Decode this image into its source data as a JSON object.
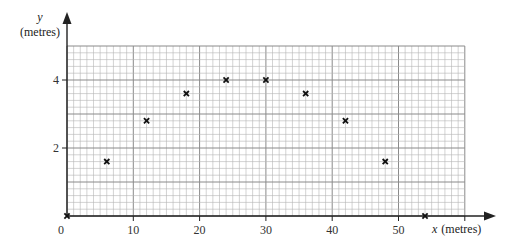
{
  "chart_data": {
    "type": "scatter",
    "title": "",
    "xlabel": "x (metres)",
    "ylabel": "y (metres)",
    "xlabel_var": "x",
    "xlabel_unit": "(metres)",
    "ylabel_var": "y",
    "ylabel_unit": "(metres)",
    "xlim": [
      0,
      60
    ],
    "ylim": [
      0,
      5
    ],
    "grid": true,
    "grid_minor_x": 1,
    "grid_minor_y": 0.2,
    "x_ticks": [
      0,
      10,
      20,
      30,
      40,
      50
    ],
    "x_tick_labels": [
      "0",
      "10",
      "20",
      "30",
      "40",
      "50"
    ],
    "y_ticks": [
      2,
      4
    ],
    "y_tick_labels": [
      "2",
      "4"
    ],
    "marker": "x",
    "series": [
      {
        "name": "points",
        "x": [
          0,
          6,
          12,
          18,
          24,
          30,
          36,
          42,
          48,
          54
        ],
        "y": [
          0,
          1.6,
          2.8,
          3.6,
          4,
          4,
          3.6,
          2.8,
          1.6,
          0
        ]
      }
    ],
    "legend": null
  },
  "colors": {
    "grid_minor": "#b5b5b5",
    "grid_major": "#8a8a8a",
    "axis": "#222222",
    "marker": "#111111"
  }
}
